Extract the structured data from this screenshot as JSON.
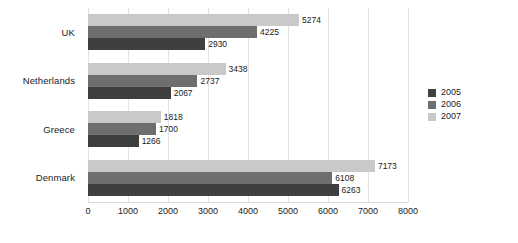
{
  "chart_data": {
    "type": "bar",
    "orientation": "horizontal",
    "title": "",
    "xlabel": "",
    "ylabel": "",
    "categories": [
      "UK",
      "Netherlands",
      "Greece",
      "Denmark"
    ],
    "series": [
      {
        "name": "2005",
        "color": "#3f3f3f",
        "values": [
          2930,
          2067,
          1266,
          6263
        ]
      },
      {
        "name": "2006",
        "color": "#6e6e6e",
        "values": [
          4225,
          2737,
          1700,
          6108
        ]
      },
      {
        "name": "2007",
        "color": "#c9c9c9",
        "values": [
          5274,
          3438,
          1818,
          7173
        ]
      }
    ],
    "xlim": [
      0,
      8000
    ],
    "xticks": [
      0,
      1000,
      2000,
      3000,
      4000,
      5000,
      6000,
      7000,
      8000
    ],
    "xtick_labels": [
      "0",
      "1000",
      "2000",
      "3000",
      "4000",
      "5000",
      "6000",
      "7000",
      "8000"
    ],
    "grid": true,
    "grid_axis": "x",
    "legend_position": "right",
    "data_labels": true,
    "bar_label_values": {
      "UK": {
        "2005": "2930",
        "2006": "4225",
        "2007": "5274"
      },
      "Netherlands": {
        "2005": "2067",
        "2006": "2737",
        "2007": "3438"
      },
      "Greece": {
        "2005": "1266",
        "2006": "1700",
        "2007": "1818"
      },
      "Denmark": {
        "2005": "6263",
        "2006": "6108",
        "2007": "7173"
      }
    }
  },
  "legend": {
    "items": [
      {
        "label": "2005",
        "color": "#3f3f3f"
      },
      {
        "label": "2006",
        "color": "#6e6e6e"
      },
      {
        "label": "2007",
        "color": "#c9c9c9"
      }
    ]
  }
}
